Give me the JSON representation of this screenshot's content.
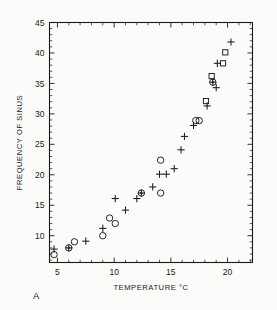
{
  "figure": {
    "panel_label": "A",
    "background_color": "#fbfbf9",
    "ink_color": "#1a1a1a"
  },
  "chart_data": {
    "type": "scatter",
    "title": "",
    "subtitle": "",
    "xlabel": "TEMPERATURE °C",
    "ylabel": "FREQUENCY OF SINUS",
    "xlim": [
      4.3,
      22.2
    ],
    "ylim": [
      5.6,
      45.0
    ],
    "xticks": [
      5,
      10,
      15,
      20
    ],
    "xticklabels": [
      "5",
      "10",
      "15",
      "20"
    ],
    "yticks": [
      10,
      15,
      20,
      25,
      30,
      35,
      40,
      45
    ],
    "yticklabels": [
      "10",
      "15",
      "20",
      "25",
      "30",
      "35",
      "40",
      "45"
    ],
    "x_minor_tick_step": 1,
    "y_minor_tick_step": 1,
    "grid": false,
    "legend": null,
    "legend_position": "none",
    "frame": "box",
    "tick_direction": "in",
    "annotations": [
      "A"
    ],
    "series": [
      {
        "name": "circle",
        "marker": "circle",
        "points": [
          [
            4.7,
            6.9
          ],
          [
            6.0,
            8.0
          ],
          [
            6.5,
            9.0
          ],
          [
            9.0,
            10.0
          ],
          [
            9.6,
            12.9
          ],
          [
            10.1,
            12.0
          ],
          [
            12.4,
            17.0
          ],
          [
            14.1,
            22.4
          ],
          [
            14.1,
            17.0
          ],
          [
            17.2,
            28.9
          ],
          [
            17.5,
            28.9
          ],
          [
            18.7,
            35.2
          ]
        ]
      },
      {
        "name": "plus",
        "marker": "plus",
        "points": [
          [
            4.7,
            7.8
          ],
          [
            6.0,
            8.0
          ],
          [
            7.5,
            9.1
          ],
          [
            9.0,
            11.2
          ],
          [
            11.0,
            14.2
          ],
          [
            10.1,
            16.1
          ],
          [
            12.0,
            16.1
          ],
          [
            12.4,
            17.0
          ],
          [
            13.4,
            18.0
          ],
          [
            14.0,
            20.1
          ],
          [
            14.6,
            20.1
          ],
          [
            15.3,
            21.0
          ],
          [
            15.9,
            24.1
          ],
          [
            16.2,
            26.3
          ],
          [
            17.0,
            28.1
          ],
          [
            18.2,
            31.3
          ],
          [
            18.7,
            35.2
          ],
          [
            19.0,
            34.3
          ],
          [
            19.1,
            38.3
          ],
          [
            20.3,
            41.8
          ]
        ]
      },
      {
        "name": "square",
        "marker": "square",
        "points": [
          [
            18.1,
            32.1
          ],
          [
            18.6,
            36.2
          ],
          [
            19.6,
            38.3
          ],
          [
            19.8,
            40.1
          ]
        ]
      }
    ]
  }
}
